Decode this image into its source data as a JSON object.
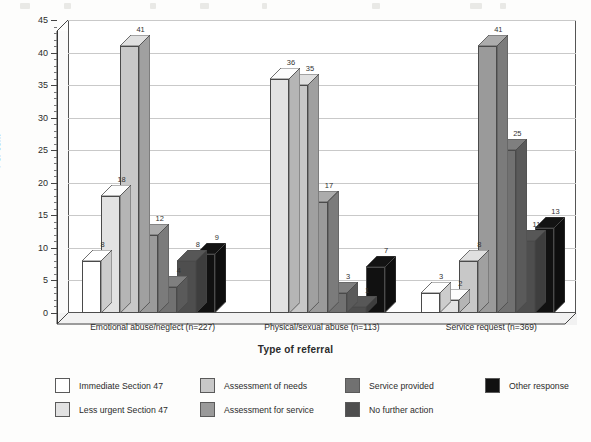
{
  "chart_data": {
    "type": "bar",
    "title": "",
    "xlabel": "Type of referral",
    "ylabel": "Per cent",
    "ylim": [
      0,
      45
    ],
    "ytick_step": 5,
    "yticks": [
      0,
      5,
      10,
      15,
      20,
      25,
      30,
      35,
      40,
      45
    ],
    "minor_tick_step": 1,
    "grid": true,
    "grid_axis": "y",
    "legend_position": "bottom",
    "style": "3d-bar",
    "categories": [
      "Emotional abuse/neglect (n=227)",
      "Physical/sexual abuse (n=113)",
      "Service request (n=369)"
    ],
    "series": [
      {
        "name": "Immediate Section 47",
        "color": "#ffffff",
        "values": [
          8,
          0,
          3
        ]
      },
      {
        "name": "Less urgent Section 47",
        "color": "#e2e2e2",
        "values": [
          18,
          36,
          2
        ]
      },
      {
        "name": "Assessment of needs",
        "color": "#c8c8c8",
        "values": [
          41,
          35,
          8
        ]
      },
      {
        "name": "Assessment for service",
        "color": "#9a9a9a",
        "values": [
          12,
          17,
          41
        ]
      },
      {
        "name": "Service provided",
        "color": "#717171",
        "values": [
          4,
          3,
          25
        ]
      },
      {
        "name": "No further action",
        "color": "#4e4e4e",
        "values": [
          8,
          1,
          11
        ]
      },
      {
        "name": "Other response",
        "color": "#111111",
        "values": [
          9,
          7,
          13
        ]
      }
    ]
  },
  "axes": {
    "y_title": "Per cent",
    "x_title": "Type of referral"
  },
  "legend": {
    "entries": [
      {
        "label": "Immediate Section 47",
        "color": "#ffffff"
      },
      {
        "label": "Less urgent Section 47",
        "color": "#e2e2e2"
      },
      {
        "label": "Assessment of needs",
        "color": "#c8c8c8"
      },
      {
        "label": "Assessment for service",
        "color": "#9a9a9a"
      },
      {
        "label": "Service provided",
        "color": "#717171"
      },
      {
        "label": "No further action",
        "color": "#4e4e4e"
      },
      {
        "label": "Other response",
        "color": "#111111"
      }
    ]
  }
}
